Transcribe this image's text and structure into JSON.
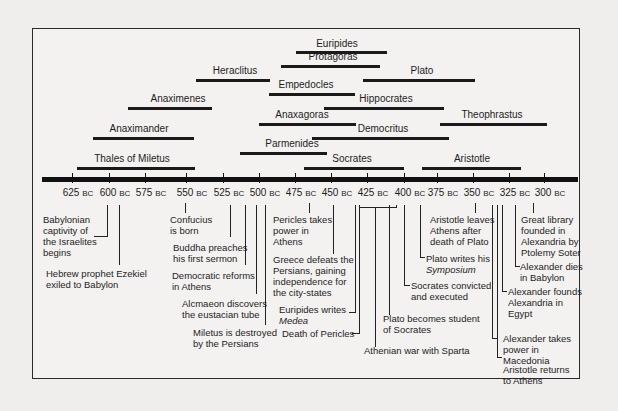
{
  "chart_data": {
    "type": "timeline",
    "title": "",
    "axis": {
      "unit": "BC",
      "ticks": [
        "625 BC",
        "600 BC",
        "575 BC",
        "550 BC",
        "525 BC",
        "500 BC",
        "475 BC",
        "450 BC",
        "425 BC",
        "400 BC",
        "375 BC",
        "350 BC",
        "325 BC",
        "300 BC"
      ],
      "range": [
        635,
        290
      ]
    },
    "lifespans": [
      {
        "name": "Euripides",
        "start": 480,
        "end": 406
      },
      {
        "name": "Protagoras",
        "start": 490,
        "end": 420
      },
      {
        "name": "Heraclitus",
        "start": 540,
        "end": 480
      },
      {
        "name": "Plato",
        "start": 427,
        "end": 347
      },
      {
        "name": "Empedocles",
        "start": 490,
        "end": 430
      },
      {
        "name": "Anaximenes",
        "start": 585,
        "end": 525
      },
      {
        "name": "Hippocrates",
        "start": 460,
        "end": 377
      },
      {
        "name": "Anaxagoras",
        "start": 500,
        "end": 428
      },
      {
        "name": "Theophrastus",
        "start": 372,
        "end": 287
      },
      {
        "name": "Anaximander",
        "start": 610,
        "end": 546
      },
      {
        "name": "Democritus",
        "start": 460,
        "end": 370
      },
      {
        "name": "Parmenides",
        "start": 515,
        "end": 450
      },
      {
        "name": "Thales of Miletus",
        "start": 624,
        "end": 546
      },
      {
        "name": "Socrates",
        "start": 469,
        "end": 399
      },
      {
        "name": "Aristotle",
        "start": 384,
        "end": 322
      }
    ],
    "events": [
      {
        "year": 597,
        "text": "Babylonian captivity of the Israelites begins"
      },
      {
        "year": 593,
        "text": "Hebrew prophet Ezekiel exiled to Babylon"
      },
      {
        "year": 551,
        "text": "Confucius is born"
      },
      {
        "year": 528,
        "text": "Buddha preaches his first sermon"
      },
      {
        "year": 508,
        "text": "Democratic reforms in Athens"
      },
      {
        "year": 500,
        "text": "Alcmaeon discovers the eustacian tube"
      },
      {
        "year": 494,
        "text": "Miletus is destroyed by the Persians"
      },
      {
        "year": 460,
        "text": "Pericles takes power in Athens"
      },
      {
        "year": 449,
        "text": "Greece defeats the Persians, gaining independence for the city-states"
      },
      {
        "year": 431,
        "text": "Euripides writes Medea"
      },
      {
        "year": 429,
        "text": "Death of Pericles"
      },
      {
        "year": "431-404",
        "text": "Athenian war with Sparta"
      },
      {
        "year": 407,
        "text": "Plato becomes student of Socrates"
      },
      {
        "year": 399,
        "text": "Socrates convicted and executed"
      },
      {
        "year": 385,
        "text": "Plato writes his Symposium"
      },
      {
        "year": 347,
        "text": "Aristotle leaves Athens after death of Plato"
      },
      {
        "year": 336,
        "text": "Alexander takes power in Macedonia"
      },
      {
        "year": 335,
        "text": "Aristotle returns to Athens"
      },
      {
        "year": 331,
        "text": "Alexander founds Alexandria in Egypt"
      },
      {
        "year": 323,
        "text": "Alexander dies in Babylon"
      },
      {
        "year": 300,
        "text": "Great library founded in Alexandria by Ptolemy Soter"
      }
    ]
  },
  "bars": [
    {
      "name": "Euripides",
      "x1": 296,
      "x2": 387,
      "y": 51,
      "lx": 337,
      "ly": 38
    },
    {
      "name": "Protagoras",
      "x1": 281,
      "x2": 380,
      "y": 65,
      "lx": 333,
      "ly": 51
    },
    {
      "name": "Heraclitus",
      "x1": 196,
      "x2": 270,
      "y": 79,
      "lx": 235,
      "ly": 65
    },
    {
      "name": "Plato",
      "x1": 363,
      "x2": 475,
      "y": 79,
      "lx": 422,
      "ly": 65
    },
    {
      "name": "Empedocles",
      "x1": 269,
      "x2": 355,
      "y": 93,
      "lx": 306,
      "ly": 79
    },
    {
      "name": "Anaximenes",
      "x1": 128,
      "x2": 212,
      "y": 107,
      "lx": 178,
      "ly": 93
    },
    {
      "name": "Hippocrates",
      "x1": 324,
      "x2": 444,
      "y": 107,
      "lx": 386,
      "ly": 93
    },
    {
      "name": "Anaxagoras",
      "x1": 259,
      "x2": 356,
      "y": 123,
      "lx": 302,
      "ly": 109
    },
    {
      "name": "Theophrastus",
      "x1": 440,
      "x2": 547,
      "y": 123,
      "lx": 492,
      "ly": 109
    },
    {
      "name": "Anaximander",
      "x1": 93,
      "x2": 194,
      "y": 137,
      "lx": 139,
      "ly": 123
    },
    {
      "name": "Democritus",
      "x1": 312,
      "x2": 449,
      "y": 137,
      "lx": 383,
      "ly": 123
    },
    {
      "name": "Parmenides",
      "x1": 240,
      "x2": 327,
      "y": 152,
      "lx": 292,
      "ly": 138
    },
    {
      "name": "Thales of Miletus",
      "x1": 77,
      "x2": 195,
      "y": 167,
      "lx": 132,
      "ly": 153
    },
    {
      "name": "Socrates",
      "x1": 304,
      "x2": 404,
      "y": 167,
      "lx": 352,
      "ly": 153
    },
    {
      "name": "Aristotle",
      "x1": 422,
      "x2": 521,
      "y": 167,
      "lx": 472,
      "ly": 153
    }
  ],
  "ticks": [
    {
      "year": "625",
      "unit": "BC",
      "x": 72
    },
    {
      "year": "600",
      "unit": "BC",
      "x": 109
    },
    {
      "year": "575",
      "unit": "BC",
      "x": 145
    },
    {
      "year": "550",
      "unit": "BC",
      "x": 186
    },
    {
      "year": "525",
      "unit": "BC",
      "x": 223
    },
    {
      "year": "500",
      "unit": "BC",
      "x": 259
    },
    {
      "year": "475",
      "unit": "BC",
      "x": 295
    },
    {
      "year": "450",
      "unit": "BC",
      "x": 331
    },
    {
      "year": "425",
      "unit": "BC",
      "x": 367
    },
    {
      "year": "400",
      "unit": "BC",
      "x": 404
    },
    {
      "year": "375",
      "unit": "BC",
      "x": 437
    },
    {
      "year": "350",
      "unit": "BC",
      "x": 473
    },
    {
      "year": "325",
      "unit": "BC",
      "x": 509
    },
    {
      "year": "300",
      "unit": "BC",
      "x": 544
    }
  ],
  "events": {
    "babylonian": [
      "Babylonian",
      "captivity of",
      "the Israelites",
      "begins"
    ],
    "ezekiel": [
      "Hebrew prophet Ezekiel",
      "exiled to Babylon"
    ],
    "confucius": [
      "Confucius",
      "is born"
    ],
    "buddha": [
      "Buddha preaches",
      "his first sermon"
    ],
    "democratic": [
      "Democratic reforms",
      "in Athens"
    ],
    "alcmaeon": [
      "Alcmaeon discovers",
      "the eustacian tube"
    ],
    "miletus": [
      "Miletus is destroyed",
      "by the Persians"
    ],
    "pericles_power": [
      "Pericles takes",
      "power in",
      "Athens"
    ],
    "greece": [
      "Greece defeats the",
      "Persians, gaining",
      "independence for",
      "the city-states"
    ],
    "euripides_writes": "Euripides writes",
    "medea": "Medea",
    "pericles_death": "Death of Pericles",
    "athenian_war": "Athenian war with Sparta",
    "plato_student": [
      "Plato becomes student",
      "of Socrates"
    ],
    "socrates_executed": [
      "Socrates convicted",
      "and executed"
    ],
    "plato_writes": "Plato writes his",
    "symposium": "Symposium",
    "aristotle_leaves": [
      "Aristotle leaves",
      "Athens after",
      "death of Plato"
    ],
    "alexander_founds": [
      "Alexander founds",
      "Alexandria in",
      "Egypt"
    ],
    "alexander_power": [
      "Alexander takes",
      "power in",
      "Macedonia"
    ],
    "aristotle_returns": [
      "Aristotle returns",
      "to Athens"
    ],
    "alexander_dies": [
      "Alexander dies",
      "in Babylon"
    ],
    "library": [
      "Great library",
      "founded in",
      "Alexandria by",
      "Ptolemy Soter"
    ]
  }
}
